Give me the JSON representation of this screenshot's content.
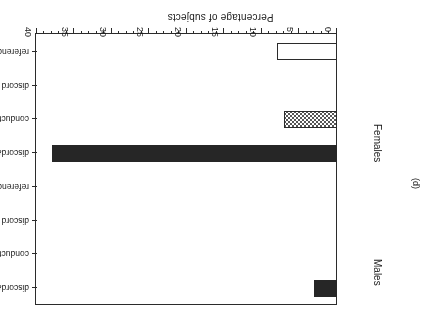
{
  "figure": {
    "panel_label": "(d)"
  },
  "chart_data": {
    "type": "bar",
    "orientation": "horizontal",
    "title": "",
    "xlabel": "Percentage of subjects",
    "ylabel": "",
    "xlim": [
      0,
      40
    ],
    "xticks": [
      0,
      5,
      10,
      15,
      20,
      25,
      30,
      35,
      40
    ],
    "xtick_labels": [
      "0",
      "5",
      "10",
      "15",
      "20",
      "25",
      "30",
      "35",
      "40"
    ],
    "minor_tick_step": 1,
    "grid": false,
    "legend": "none",
    "rotated_180": true,
    "groups": [
      {
        "name": "Females",
        "categories": [
          "reference group",
          "discord",
          "conduct",
          "discord&conduct"
        ],
        "values": [
          8,
          0,
          7,
          38
        ],
        "fills": [
          "open",
          "open",
          "checker",
          "solid"
        ]
      },
      {
        "name": "Males",
        "categories": [
          "reference group",
          "discord",
          "conduct",
          "discord&conduct"
        ],
        "values": [
          0,
          0,
          0,
          3
        ],
        "fills": [
          "open",
          "open",
          "checker",
          "solid"
        ]
      }
    ],
    "colors": {
      "solid": "#262626",
      "checker": "#555555",
      "open": "#ffffff",
      "axis": "#2b2b2b"
    }
  }
}
